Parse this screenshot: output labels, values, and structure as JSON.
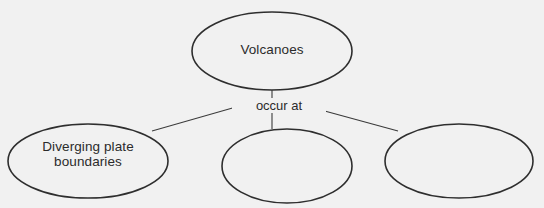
{
  "diagram": {
    "type": "concept-map",
    "background_color": "#f1f1f1",
    "stroke_color": "#2e2e2e",
    "text_color": "#2b2b2b",
    "root": {
      "label": "Volcanoes"
    },
    "connector": {
      "label": "occur at"
    },
    "branches": [
      {
        "label": "Diverging plate\nboundaries"
      },
      {
        "label": ""
      },
      {
        "label": ""
      }
    ]
  }
}
